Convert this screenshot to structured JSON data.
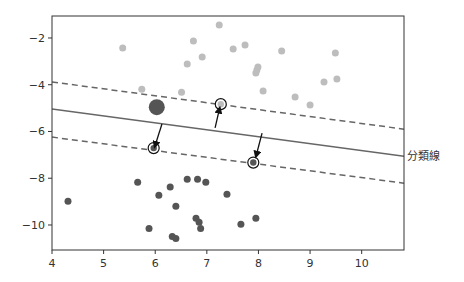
{
  "chart_data": {
    "type": "scatter",
    "title": "",
    "xlabel": "",
    "ylabel": "",
    "xlim": [
      4.0,
      10.82
    ],
    "ylim": [
      -11.07,
      -1.06
    ],
    "grid": false,
    "legend": null,
    "x_ticks": [
      4,
      5,
      6,
      7,
      8,
      9,
      10
    ],
    "x_tick_labels": [
      "4",
      "5",
      "6",
      "7",
      "8",
      "9",
      "10"
    ],
    "y_ticks": [
      -2,
      -4,
      -6,
      -8,
      -10
    ],
    "y_tick_labels": [
      "−2",
      "−4",
      "−6",
      "−8",
      "−10"
    ],
    "series": [
      {
        "name": "upper class",
        "color": "#bdbdbd",
        "points": [
          [
            5.37,
            -2.43
          ],
          [
            6.74,
            -2.13
          ],
          [
            6.91,
            -2.81
          ],
          [
            6.62,
            -3.11
          ],
          [
            6.51,
            -4.32
          ],
          [
            5.74,
            -4.19
          ],
          [
            7.24,
            -1.45
          ],
          [
            7.51,
            -2.47
          ],
          [
            7.74,
            -2.3
          ],
          [
            8.45,
            -2.56
          ],
          [
            9.49,
            -2.64
          ],
          [
            7.99,
            -3.24
          ],
          [
            7.97,
            -3.37
          ],
          [
            7.95,
            -3.5
          ],
          [
            9.27,
            -3.88
          ],
          [
            9.52,
            -3.75
          ],
          [
            8.09,
            -4.27
          ],
          [
            8.71,
            -4.53
          ],
          [
            9.0,
            -4.87
          ]
        ]
      },
      {
        "name": "lower class",
        "color": "#555555",
        "points": [
          [
            4.31,
            -8.98
          ],
          [
            5.66,
            -8.17
          ],
          [
            6.29,
            -8.38
          ],
          [
            6.07,
            -8.73
          ],
          [
            6.4,
            -9.2
          ],
          [
            5.88,
            -10.15
          ],
          [
            6.33,
            -10.49
          ],
          [
            6.4,
            -10.58
          ],
          [
            6.62,
            -8.04
          ],
          [
            6.82,
            -8.04
          ],
          [
            6.98,
            -8.17
          ],
          [
            7.39,
            -8.68
          ],
          [
            6.79,
            -9.71
          ],
          [
            6.85,
            -9.88
          ],
          [
            6.88,
            -10.15
          ],
          [
            7.66,
            -9.97
          ],
          [
            7.95,
            -9.71
          ]
        ]
      }
    ],
    "highlight_point": {
      "x": 6.03,
      "y": -4.96,
      "color": "#555555",
      "note": "large dark point"
    },
    "support_vectors": [
      {
        "x": 5.97,
        "y": -6.71,
        "fill": "#555555"
      },
      {
        "x": 7.27,
        "y": -4.83,
        "fill": "#bdbdbd"
      },
      {
        "x": 7.9,
        "y": -7.33,
        "fill": "#555555"
      }
    ],
    "arrows": [
      {
        "from": [
          6.13,
          -5.68
        ],
        "to": [
          5.99,
          -6.66
        ]
      },
      {
        "from": [
          7.16,
          -5.85
        ],
        "to": [
          7.25,
          -4.98
        ]
      },
      {
        "from": [
          8.07,
          -6.07
        ],
        "to": [
          7.95,
          -7.08
        ]
      }
    ],
    "lines": [
      {
        "name": "decision boundary",
        "style": "solid",
        "color": "#666666",
        "from": [
          4.0,
          -5.04
        ],
        "to": [
          10.82,
          -7.06
        ]
      },
      {
        "name": "upper margin",
        "style": "dashed",
        "color": "#666666",
        "from": [
          4.0,
          -3.88
        ],
        "to": [
          10.82,
          -5.9
        ]
      },
      {
        "name": "lower margin",
        "style": "dashed",
        "color": "#666666",
        "from": [
          4.0,
          -6.24
        ],
        "to": [
          10.82,
          -8.21
        ]
      }
    ],
    "annotations": [
      {
        "text": "分類線",
        "x": 10.88,
        "y": -7.06,
        "target": "decision boundary"
      }
    ]
  },
  "layout_px": {
    "plot": {
      "left": 52,
      "top": 16,
      "right": 404,
      "bottom": 250
    }
  }
}
